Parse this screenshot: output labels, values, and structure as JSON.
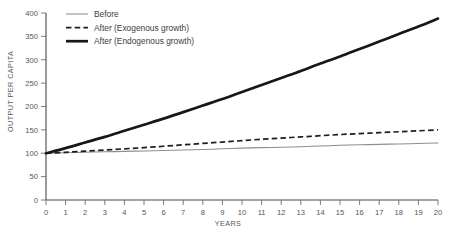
{
  "chart_data": {
    "type": "line",
    "title": "",
    "xlabel": "YEARS",
    "ylabel": "OUTPUT PER CAPITA",
    "xlim": [
      0,
      20
    ],
    "ylim": [
      0,
      400
    ],
    "grid": false,
    "legend_position": "top-left",
    "x": [
      0,
      1,
      2,
      3,
      4,
      5,
      6,
      7,
      8,
      9,
      10,
      11,
      12,
      13,
      14,
      15,
      16,
      17,
      18,
      19,
      20
    ],
    "xticks": [
      "0",
      "1",
      "2",
      "3",
      "4",
      "5",
      "6",
      "7",
      "8",
      "9",
      "10",
      "11",
      "12",
      "13",
      "14",
      "15",
      "16",
      "17",
      "18",
      "19",
      "20"
    ],
    "yticks": [
      "0",
      "50",
      "100",
      "150",
      "200",
      "250",
      "300",
      "350",
      "400"
    ],
    "ytick_values": [
      0,
      50,
      100,
      150,
      200,
      250,
      300,
      350,
      400
    ],
    "series": [
      {
        "name": "Before",
        "style": "thin-solid",
        "color": "#8e8e8e",
        "values": [
          100,
          101,
          102,
          103,
          104,
          105,
          106,
          107,
          108,
          109.5,
          111,
          112,
          113,
          114,
          115.5,
          117,
          118,
          119,
          120,
          121,
          122
        ]
      },
      {
        "name": "After (Exogenous growth)",
        "style": "dashed",
        "color": "#1e1e1e",
        "values": [
          100,
          102,
          104.5,
          107,
          109.5,
          112,
          115,
          118,
          121,
          124,
          127,
          130,
          132.5,
          135,
          137.5,
          140,
          142,
          144,
          146,
          148,
          150
        ]
      },
      {
        "name": "After (Endogenous growth)",
        "style": "thick-solid",
        "color": "#171717",
        "values": [
          100,
          111,
          123,
          135,
          148,
          161,
          174,
          188,
          202,
          216,
          231,
          246,
          261,
          276,
          292,
          307,
          323,
          339,
          355,
          371,
          388
        ]
      }
    ]
  },
  "legend": {
    "items": [
      {
        "label": "Before"
      },
      {
        "label": "After (Exogenous growth)"
      },
      {
        "label": "After (Endogenous growth)"
      }
    ]
  }
}
